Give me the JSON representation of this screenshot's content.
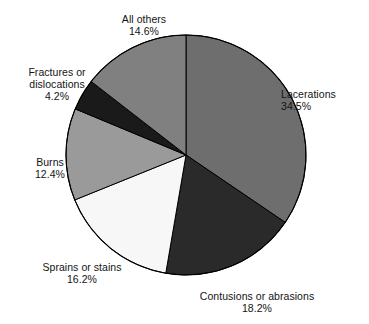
{
  "chart_data": {
    "type": "pie",
    "title": "",
    "subtitle": "",
    "xlabel": "",
    "ylabel": "",
    "legend_position": "none",
    "grid": false,
    "units": "percent",
    "start_angle_deg": 0,
    "direction": "clockwise",
    "center": {
      "x": 186,
      "y": 155,
      "r": 120
    },
    "categories": [
      "Lacerations",
      "Contusions or abrasions",
      "Sprains or stains",
      "Burns",
      "Fractures or dislocations",
      "All others"
    ],
    "values": [
      34.5,
      18.2,
      16.2,
      12.4,
      4.2,
      14.6
    ],
    "slices": [
      {
        "label": "Lacerations",
        "value": "34.5%",
        "value_number": 34.5,
        "color": "#6e6e6e",
        "start_deg": 0.0,
        "end_deg": 124.2
      },
      {
        "label": "Contusions or abrasions",
        "value": "18.2%",
        "value_number": 18.2,
        "color": "#2a2a2a",
        "start_deg": 124.2,
        "end_deg": 189.7
      },
      {
        "label": "Sprains or stains",
        "value": "16.2%",
        "value_number": 16.2,
        "color": "#f7f7f7",
        "start_deg": 189.7,
        "end_deg": 248.0
      },
      {
        "label": "Burns",
        "value": "12.4%",
        "value_number": 12.4,
        "color": "#9a9a9a",
        "start_deg": 248.0,
        "end_deg": 292.6
      },
      {
        "label": "Fractures or dislocations",
        "value": "4.2%",
        "value_number": 4.2,
        "color": "#1a1a1a",
        "start_deg": 292.6,
        "end_deg": 307.8
      },
      {
        "label": "All others",
        "value": "14.6%",
        "value_number": 14.6,
        "color": "#808080",
        "start_deg": 307.8,
        "end_deg": 360.0
      }
    ]
  },
  "labels": {
    "all_others": {
      "name": "All others",
      "value": "14.6%"
    },
    "lacerations": {
      "name": "Lacerations",
      "value": "34.5%"
    },
    "fractures": {
      "name_line1": "Fractures or",
      "name_line2": "dislocations",
      "value": "4.2%"
    },
    "burns": {
      "name": "Burns",
      "value": "12.4%"
    },
    "sprains": {
      "name": "Sprains or stains",
      "value": "16.2%"
    },
    "contusions": {
      "name": "Contusions or abrasions",
      "value": "18.2%"
    }
  },
  "style": {
    "background": "#ffffff",
    "outline": "#000000",
    "text": "#141414"
  }
}
